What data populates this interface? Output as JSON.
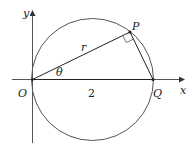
{
  "diagram": {
    "type": "geometry",
    "labels": {
      "y_axis": "y",
      "x_axis": "x",
      "origin": "O",
      "point_p": "P",
      "point_q": "Q",
      "segment_op": "r",
      "angle": "θ",
      "segment_oq": "2"
    },
    "colors": {
      "stroke": "#333333",
      "circle": "#555555",
      "text": "#222222"
    }
  }
}
